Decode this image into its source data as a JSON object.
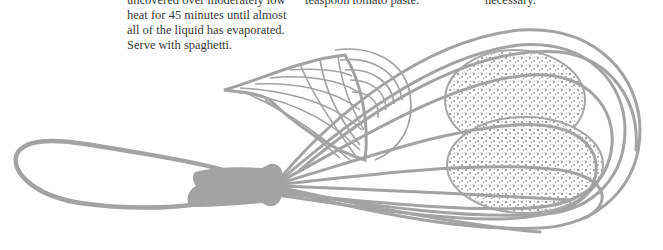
{
  "recipe": {
    "column_1": {
      "lines": [
        "uncovered over moderately low",
        "heat for 45 minutes until almost",
        "all of the liquid has evaporated.",
        "Serve with spaghetti."
      ]
    },
    "column_2": {
      "lines": [
        "teaspoon tomato paste."
      ]
    },
    "column_3": {
      "lines": [
        "necessary."
      ]
    }
  },
  "illustration": {
    "subject": "whisk-with-leaf-and-tomatoes",
    "ink_color": "#a3a3a3",
    "paper_color": "#ffffff",
    "text_color": "#3a3a3a"
  }
}
